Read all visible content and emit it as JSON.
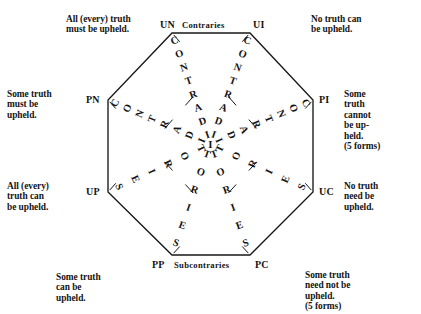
{
  "figure": {
    "center_letter": "I",
    "diagonal_word": "CONTRADICTORIES",
    "ink_color": "#171717",
    "background_color": "#ffffff"
  },
  "edges": {
    "top": {
      "left_vertex": "UN",
      "label": "Contraries",
      "right_vertex": "UI"
    },
    "bottom": {
      "left_vertex": "PP",
      "label": "Subcontraries",
      "right_vertex": "PC"
    }
  },
  "vertices": [
    {
      "code": "UN",
      "position": "top-left"
    },
    {
      "code": "UI",
      "position": "top-right"
    },
    {
      "code": "PN",
      "position": "left-upper"
    },
    {
      "code": "PI",
      "position": "right-upper"
    },
    {
      "code": "UP",
      "position": "left-lower"
    },
    {
      "code": "UC",
      "position": "right-lower"
    },
    {
      "code": "PP",
      "position": "bottom-left"
    },
    {
      "code": "PC",
      "position": "bottom-right"
    }
  ],
  "glosses": [
    {
      "for": "UN",
      "position": "top-left",
      "text": "All (every) truth\nmust be upheld."
    },
    {
      "for": "UI",
      "position": "top-right",
      "text": "No truth can\nbe upheld."
    },
    {
      "for": "PN",
      "position": "left-upper",
      "text": "Some truth\nmust be\nupheld."
    },
    {
      "for": "PI",
      "position": "right-upper",
      "text": "Some\ntruth\ncannot\nbe up-\nheld.\n(5 forms)"
    },
    {
      "for": "UP",
      "position": "left-lower",
      "text": "All (every)\ntruth can\nbe upheld."
    },
    {
      "for": "UC",
      "position": "right-lower",
      "text": "No truth\nneed be\nupheld."
    },
    {
      "for": "PP",
      "position": "bottom-left",
      "text": "Some truth\ncan be\nupheld."
    },
    {
      "for": "PC",
      "position": "bottom-right",
      "text": "Some truth\nneed not be\nupheld.\n(5 forms)"
    }
  ],
  "diagonals": [
    {
      "name": "UN-UC",
      "word": "CONTRADICTORIES",
      "from_vertex": "UN",
      "to_vertex": "UC"
    },
    {
      "name": "UI-UP",
      "word": "CONTRADICTORIES",
      "from_vertex": "UI",
      "to_vertex": "UP"
    },
    {
      "name": "PN-PC",
      "word": "CONTRADICTORIES",
      "from_vertex": "PN",
      "to_vertex": "PC"
    },
    {
      "name": "PI-PP",
      "word": "CONTRADICTORIES",
      "from_vertex": "PI",
      "to_vertex": "PP"
    }
  ]
}
